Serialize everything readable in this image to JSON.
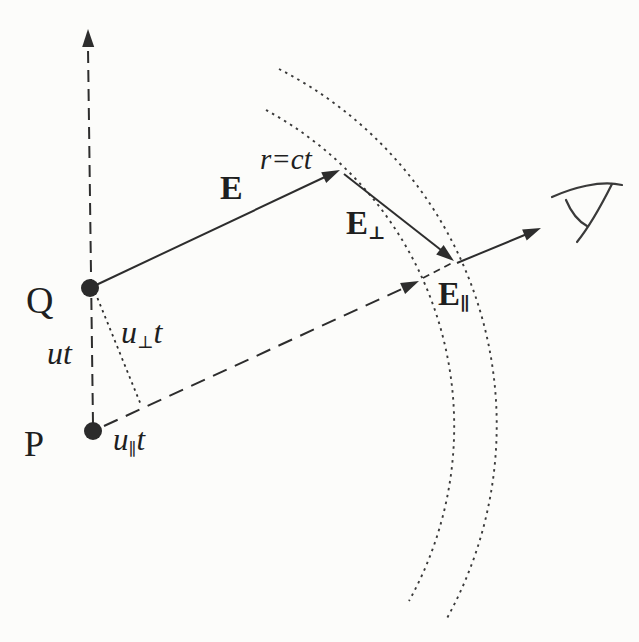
{
  "figure": {
    "colors": {
      "background": "#fcfcfa",
      "ink": "#2d2d2d"
    },
    "labels": {
      "q": "Q",
      "p": "P",
      "ut": "ut",
      "u_perp_t": {
        "pre": "u",
        "sub": "⊥",
        "post": "t"
      },
      "u_par_t": {
        "pre": "u",
        "sub": "∥",
        "post": "t"
      },
      "e": "E",
      "r_eq_ct": "r=ct",
      "e_perp": {
        "pre": "E",
        "sub": "⊥"
      },
      "e_par": {
        "pre": "E",
        "sub": "∥"
      }
    },
    "icons": {
      "observer": "eye-icon"
    }
  }
}
